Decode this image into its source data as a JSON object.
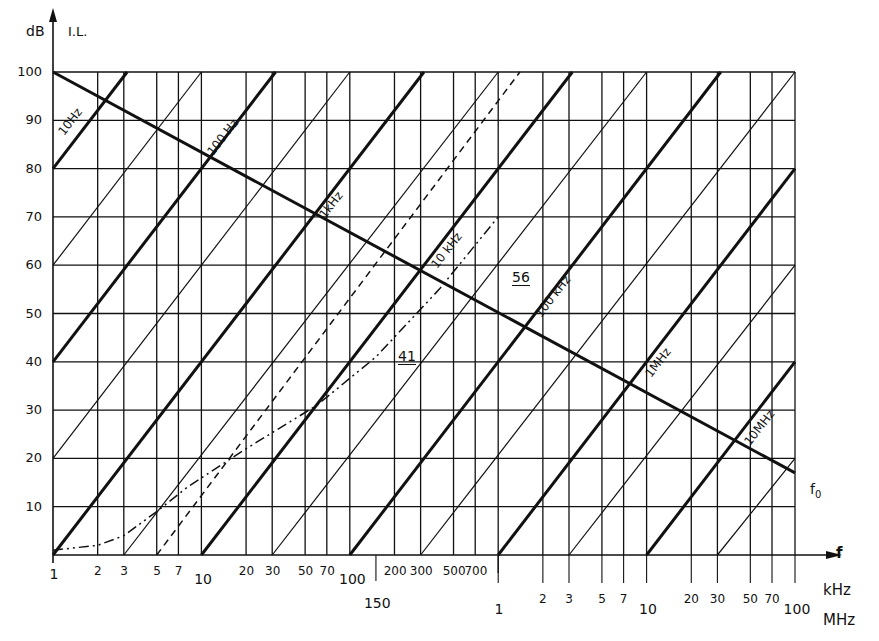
{
  "chart_data": {
    "type": "line",
    "title": "",
    "ylabel": "dB",
    "y_quantity": "I.L.",
    "xlabel": "f",
    "x_scale": "log",
    "xlim_kHz": [
      1,
      100000
    ],
    "ylim": [
      0,
      100
    ],
    "grid": true,
    "y_ticks": [
      0,
      10,
      20,
      30,
      40,
      50,
      60,
      70,
      80,
      90,
      100
    ],
    "y_tick_labels": [
      "",
      "10",
      "20",
      "30",
      "40",
      "50",
      "60",
      "70",
      "80",
      "90",
      "100"
    ],
    "x_ticks_kHz": [
      1,
      2,
      3,
      5,
      7,
      10,
      20,
      30,
      50,
      70,
      100,
      200,
      300,
      500,
      700
    ],
    "x_tick_labels_kHz": [
      "1",
      "2",
      "3",
      "5",
      "7",
      "10",
      "20",
      "30",
      "50",
      "70",
      "100",
      "200",
      "300",
      "500",
      "700"
    ],
    "x_extra_tick_kHz": {
      "value": 150,
      "label": "150"
    },
    "x_ticks_MHz": [
      1,
      2,
      3,
      5,
      7,
      10,
      20,
      30,
      50,
      70,
      100
    ],
    "x_tick_labels_MHz": [
      "1",
      "2",
      "3",
      "5",
      "7",
      "10",
      "20",
      "30",
      "50",
      "70",
      "100"
    ],
    "x_unit_labels": [
      "kHz",
      "MHz"
    ],
    "series": [
      {
        "name": "10Hz",
        "style": "thick",
        "slope_dB_per_decade": 40,
        "points_kHz_dB": [
          [
            1,
            80
          ],
          [
            3.16,
            100
          ]
        ]
      },
      {
        "name": "100Hz",
        "style": "thick",
        "slope_dB_per_decade": 40,
        "points_kHz_dB": [
          [
            1,
            40
          ],
          [
            31.6,
            100
          ]
        ]
      },
      {
        "name": "1kHz",
        "style": "thick",
        "slope_dB_per_decade": 40,
        "points_kHz_dB": [
          [
            1,
            0
          ],
          [
            316,
            100
          ]
        ]
      },
      {
        "name": "10kHz",
        "style": "thick",
        "slope_dB_per_decade": 40,
        "points_kHz_dB": [
          [
            10,
            0
          ],
          [
            3160,
            100
          ]
        ]
      },
      {
        "name": "100kHz",
        "style": "thick",
        "slope_dB_per_decade": 40,
        "points_kHz_dB": [
          [
            100,
            0
          ],
          [
            31600,
            100
          ]
        ]
      },
      {
        "name": "1MHz",
        "style": "thick",
        "slope_dB_per_decade": 40,
        "points_kHz_dB": [
          [
            1000,
            0
          ],
          [
            100000,
            80
          ]
        ]
      },
      {
        "name": "10MHz",
        "style": "thick",
        "slope_dB_per_decade": 40,
        "points_kHz_dB": [
          [
            10000,
            0
          ],
          [
            100000,
            40
          ]
        ]
      },
      {
        "name": "thin-a",
        "style": "thin",
        "points_kHz_dB": [
          [
            1,
            60
          ],
          [
            10,
            100
          ]
        ]
      },
      {
        "name": "thin-b",
        "style": "thin",
        "points_kHz_dB": [
          [
            1,
            20
          ],
          [
            100,
            100
          ]
        ]
      },
      {
        "name": "thin-c",
        "style": "thin",
        "points_kHz_dB": [
          [
            3,
            0
          ],
          [
            1000,
            100
          ]
        ]
      },
      {
        "name": "thin-d",
        "style": "thin",
        "points_kHz_dB": [
          [
            30,
            0
          ],
          [
            10000,
            100
          ]
        ]
      },
      {
        "name": "thin-e",
        "style": "thin",
        "points_kHz_dB": [
          [
            300,
            0
          ],
          [
            100000,
            100
          ]
        ]
      },
      {
        "name": "thin-f",
        "style": "thin",
        "points_kHz_dB": [
          [
            3000,
            0
          ],
          [
            100000,
            60
          ]
        ]
      },
      {
        "name": "thin-g",
        "style": "thin",
        "points_kHz_dB": [
          [
            30000,
            0
          ],
          [
            100000,
            20
          ]
        ]
      },
      {
        "name": "f0",
        "style": "thick",
        "points_kHz_dB": [
          [
            1,
            100
          ],
          [
            100000,
            17
          ]
        ]
      },
      {
        "name": "dashed",
        "style": "dashed",
        "points_kHz_dB": [
          [
            5,
            0
          ],
          [
            1400,
            100
          ]
        ]
      },
      {
        "name": "dash-dot curve",
        "style": "dashdot",
        "points_kHz_dB": [
          [
            1,
            1
          ],
          [
            2,
            2
          ],
          [
            3,
            4
          ],
          [
            5,
            9
          ],
          [
            8,
            14
          ],
          [
            20,
            22
          ],
          [
            60,
            31
          ],
          [
            150,
            41
          ],
          [
            400,
            55
          ],
          [
            1000,
            70
          ]
        ]
      }
    ],
    "annotations": [
      {
        "text": "10Hz",
        "at_kHz_dB": [
          1.6,
          90
        ]
      },
      {
        "text": "100 Hz",
        "at_kHz_dB": [
          16,
          88
        ]
      },
      {
        "text": "1kHz",
        "at_kHz_dB": [
          160,
          72
        ]
      },
      {
        "text": "10 kHz",
        "at_kHz_dB": [
          1600,
          65
        ]
      },
      {
        "text": "100 kHz",
        "at_kHz_dB": [
          16000,
          52
        ]
      },
      {
        "text": "1MHz",
        "at_kHz_dB": [
          160000,
          39
        ]
      },
      {
        "text": "10MHz",
        "at_kHz_dB": [
          1600000,
          25
        ]
      },
      {
        "text": "56",
        "at_kHz_dB": [
          900,
          56
        ],
        "underlined": true
      },
      {
        "text": "41",
        "at_kHz_dB": [
          170,
          41
        ],
        "underlined": true
      },
      {
        "text": "f0",
        "at_kHz_dB": [
          110000,
          14
        ]
      }
    ]
  },
  "labels": {
    "y_unit": "dB",
    "y_quantity": "I.L.",
    "x_var": "f",
    "x_unit_1": "kHz",
    "x_unit_2": "MHz",
    "f0": "f",
    "f0_sub": "0",
    "mark_56": "56",
    "mark_41": "41",
    "line_10hz": "10Hz",
    "line_100hz": "100 Hz",
    "line_1khz": "1kHz",
    "line_10khz": "10 kHz",
    "line_100khz": "100 kHz",
    "line_1mhz": "1MHz",
    "line_10mhz": "10MHz"
  },
  "colors": {
    "ink": "#111111",
    "paper": "#ffffff"
  }
}
